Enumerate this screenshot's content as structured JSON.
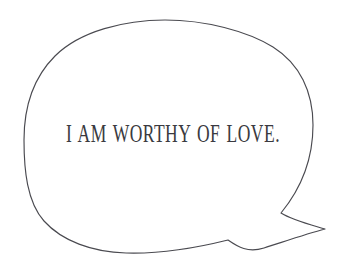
{
  "canvas": {
    "width": 346,
    "height": 273,
    "background_color": "#ffffff"
  },
  "artwork": {
    "name": "hand-drawn speech bubble",
    "style": "hand-drawn single-line outline",
    "stroke_color": "#4a4a50",
    "fill_color": "#ffffff",
    "stroke_width": 1.15,
    "tail": {
      "name": "speech-bubble-tail",
      "position": "bottom-right",
      "shape": "hooked swoosh pointing right",
      "tip_x": 325,
      "tip_y": 229
    },
    "path": "M 165,20 C 205,20 247,31 273,47 C 300,64 313,92 313,125 C 313,155 304,185 281,213 C 292,220 308,224 325,229 C 306,234 283,242 264,248 C 248,253 238,247 228,240 C 200,247 160,254 126,253 C 92,252 62,241 44,221 C 27,202 24,170 24,140 C 24,108 33,78 55,56 C 80,31 125,20 165,20 Z"
  },
  "quote": {
    "text": "I AM WORTHY OF LOVE.",
    "color": "#3a3a40",
    "align": "center"
  }
}
